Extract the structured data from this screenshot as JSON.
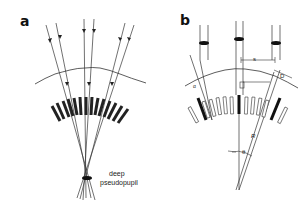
{
  "figure": {
    "panels": [
      {
        "id": "a",
        "label": "a",
        "annotations": {
          "pseudopupil_line1": "deep",
          "pseudopupil_line2": "pseudopupil"
        },
        "description": "Light rays converging through a fan of rhabdoms/ommatidia toward a deep pseudopupil"
      },
      {
        "id": "b",
        "label": "b",
        "annotations": {
          "s": "s",
          "d": "D",
          "alpha": "α",
          "r": "R",
          "theta": "θ"
        },
        "description": "Geometry of ommatidial array with spacing s, facet diameter D, radius R and interommatidial angle θ"
      }
    ]
  }
}
